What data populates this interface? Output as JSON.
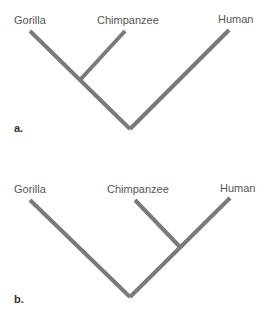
{
  "diagram": {
    "type": "phylogenetic-trees",
    "line_color": "#7a7a7a",
    "panels": [
      {
        "tag": "a.",
        "taxa": [
          {
            "name": "Gorilla"
          },
          {
            "name": "Chimpanzee"
          },
          {
            "name": "Human"
          }
        ],
        "topology": "((Gorilla, Chimpanzee), Human)"
      },
      {
        "tag": "b.",
        "taxa": [
          {
            "name": "Gorilla"
          },
          {
            "name": "Chimpanzee"
          },
          {
            "name": "Human"
          }
        ],
        "topology": "(Gorilla, (Chimpanzee, Human))"
      }
    ]
  }
}
